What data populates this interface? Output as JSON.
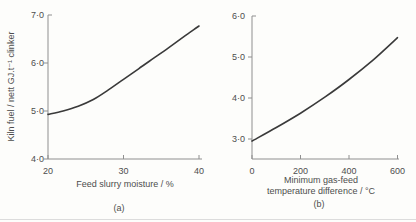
{
  "figure": {
    "colors": {
      "background": "#fdfdfb",
      "text": "#4d4d4d",
      "axis": "#8f8f8f",
      "curve": "#3a3a3a",
      "rule": "#dcdcdc"
    }
  },
  "chart_data": [
    {
      "type": "line",
      "panel": "a",
      "caption": "(a)",
      "title": "",
      "xlabel": "Feed slurry moisture / %",
      "ylabel": "Kiln fuel / nett GJ.t⁻¹ clinker",
      "xlim": [
        20,
        40.4
      ],
      "ylim": [
        4.0,
        7.0
      ],
      "grid": false,
      "legend": "none",
      "x_ticks": [
        20,
        30,
        40
      ],
      "x_tick_labels": [
        "20",
        "30",
        "40"
      ],
      "y_ticks": [
        4,
        5,
        6,
        7
      ],
      "y_tick_labels": [
        "4·0",
        "5·0",
        "6·0",
        "7·0"
      ],
      "series": [
        {
          "name": "kiln-fuel-vs-slurry-moisture",
          "x": [
            20,
            22,
            24,
            26,
            28,
            30,
            32,
            34,
            36,
            38,
            40
          ],
          "y": [
            4.93,
            5.0,
            5.1,
            5.24,
            5.44,
            5.66,
            5.88,
            6.1,
            6.32,
            6.55,
            6.77
          ]
        }
      ]
    },
    {
      "type": "line",
      "panel": "b",
      "caption": "(b)",
      "title": "",
      "xlabel": "Minimum gas-feed temperature difference / °C",
      "xlabel_lines": [
        "Minimum gas-feed",
        "temperature difference / °C"
      ],
      "ylabel": "",
      "xlim": [
        0,
        600
      ],
      "ylim": [
        2.5,
        6.0
      ],
      "grid": false,
      "legend": "none",
      "x_ticks": [
        0,
        200,
        400,
        600
      ],
      "x_tick_labels": [
        "0",
        "200",
        "400",
        "600"
      ],
      "y_ticks": [
        3,
        4,
        5,
        6
      ],
      "y_tick_labels": [
        "3·0",
        "4·0",
        "5·0",
        "6·0"
      ],
      "series": [
        {
          "name": "kiln-fuel-vs-gas-feed-temp-difference",
          "x": [
            0,
            100,
            200,
            300,
            400,
            500,
            600
          ],
          "y": [
            2.95,
            3.28,
            3.63,
            4.02,
            4.45,
            4.93,
            5.47
          ]
        }
      ]
    }
  ]
}
